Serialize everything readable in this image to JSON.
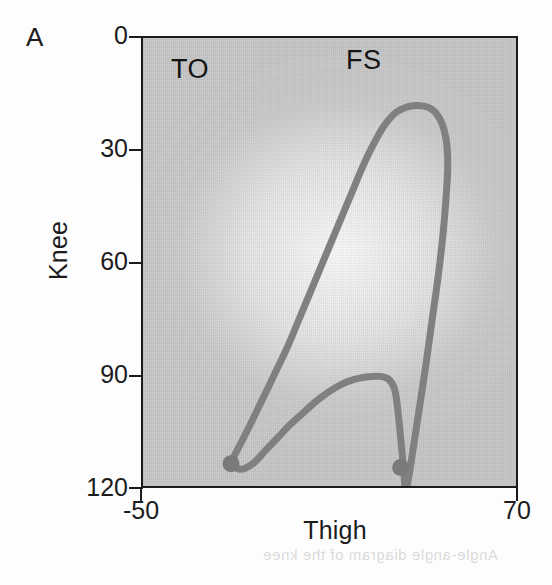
{
  "figure": {
    "panel_letter": "A",
    "background_color": "#c9c9c9",
    "curve_color": "#808080",
    "axis_color": "#1c1c1c",
    "ghost_text": "Angle-angle diagram of the knee"
  },
  "axes": {
    "x": {
      "label": "Thigh",
      "ticks": [
        "-50",
        "70"
      ],
      "tick_values": [
        -50,
        70
      ],
      "range": [
        -50,
        70
      ]
    },
    "y": {
      "label": "Knee",
      "ticks": [
        "0",
        "30",
        "60",
        "90",
        "120"
      ],
      "tick_values": [
        0,
        30,
        60,
        90,
        120
      ],
      "range": [
        0,
        120
      ],
      "inverted": true
    }
  },
  "annotations": [
    {
      "name": "toe-off",
      "label": "TO",
      "x": -22,
      "y": 7
    },
    {
      "name": "foot-strike",
      "label": "FS",
      "x": 32,
      "y": 6
    }
  ],
  "chart_data": {
    "type": "line",
    "title": "",
    "subtitle": "",
    "xlabel": "Thigh",
    "ylabel": "Knee",
    "xlim": [
      -50,
      70
    ],
    "ylim": [
      120,
      0
    ],
    "grid": false,
    "legend": "none",
    "panel": "A",
    "series": [
      {
        "name": "knee-thigh angle-angle cycle",
        "color": "#808080",
        "closed": true,
        "points": [
          [
            -22.0,
            7.0
          ],
          [
            -19.0,
            5.5
          ],
          [
            -15.0,
            7.0
          ],
          [
            -11.0,
            10.5
          ],
          [
            -7.0,
            14.0
          ],
          [
            -3.0,
            17.5
          ],
          [
            1.0,
            20.5
          ],
          [
            5.0,
            23.5
          ],
          [
            9.0,
            26.0
          ],
          [
            13.0,
            28.0
          ],
          [
            17.0,
            29.3
          ],
          [
            21.0,
            30.0
          ],
          [
            25.0,
            30.2
          ],
          [
            28.0,
            29.5
          ],
          [
            30.0,
            27.0
          ],
          [
            31.0,
            22.0
          ],
          [
            32.0,
            14.0
          ],
          [
            33.0,
            5.0
          ],
          [
            33.5,
            0.0
          ],
          [
            34.5,
            3.0
          ],
          [
            36.0,
            11.0
          ],
          [
            38.0,
            22.0
          ],
          [
            40.0,
            33.0
          ],
          [
            42.0,
            45.0
          ],
          [
            44.0,
            57.0
          ],
          [
            45.5,
            68.0
          ],
          [
            46.5,
            78.0
          ],
          [
            47.0,
            86.0
          ],
          [
            46.5,
            93.0
          ],
          [
            44.5,
            98.5
          ],
          [
            41.0,
            101.5
          ],
          [
            36.0,
            102.0
          ],
          [
            31.0,
            100.5
          ],
          [
            27.0,
            97.0
          ],
          [
            23.5,
            92.0
          ],
          [
            20.0,
            86.0
          ],
          [
            16.0,
            78.0
          ],
          [
            12.0,
            70.0
          ],
          [
            8.0,
            62.0
          ],
          [
            4.0,
            54.0
          ],
          [
            0.0,
            46.0
          ],
          [
            -4.0,
            38.0
          ],
          [
            -8.0,
            31.0
          ],
          [
            -12.0,
            24.0
          ],
          [
            -15.5,
            18.0
          ],
          [
            -18.5,
            13.0
          ],
          [
            -21.0,
            9.0
          ],
          [
            -22.0,
            7.0
          ]
        ]
      }
    ],
    "markers": [
      {
        "label": "TO",
        "name": "toe-off",
        "x": -22,
        "y": 7,
        "color": "#7a7a7a"
      },
      {
        "label": "FS",
        "name": "foot-strike",
        "x": 32,
        "y": 6,
        "color": "#7a7a7a"
      }
    ]
  }
}
